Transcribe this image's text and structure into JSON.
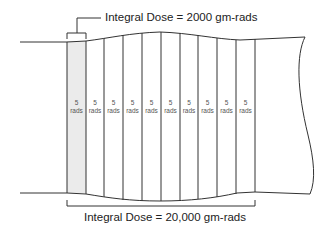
{
  "diagram": {
    "top_annotation": "Integral Dose = 2000 gm-rads",
    "bottom_annotation": "Integral Dose = 20,000 gm-rads",
    "column_value": "5",
    "column_unit": "rads",
    "columns": [
      {
        "x": 67,
        "value": "5",
        "unit": "rads",
        "highlighted": true
      },
      {
        "x": 86,
        "value": "5",
        "unit": "rads",
        "highlighted": false
      },
      {
        "x": 104,
        "value": "5",
        "unit": "rads",
        "highlighted": false
      },
      {
        "x": 123,
        "value": "5",
        "unit": "rads",
        "highlighted": false
      },
      {
        "x": 142,
        "value": "5",
        "unit": "rads",
        "highlighted": false
      },
      {
        "x": 161,
        "value": "5",
        "unit": "rads",
        "highlighted": false
      },
      {
        "x": 180,
        "value": "5",
        "unit": "rads",
        "highlighted": false
      },
      {
        "x": 198,
        "value": "5",
        "unit": "rads",
        "highlighted": false
      },
      {
        "x": 217,
        "value": "5",
        "unit": "rads",
        "highlighted": false
      },
      {
        "x": 236,
        "value": "5",
        "unit": "rads",
        "highlighted": false
      }
    ],
    "colors": {
      "line": "#333333",
      "highlight": "#ebebeb",
      "text": "#222222"
    }
  }
}
